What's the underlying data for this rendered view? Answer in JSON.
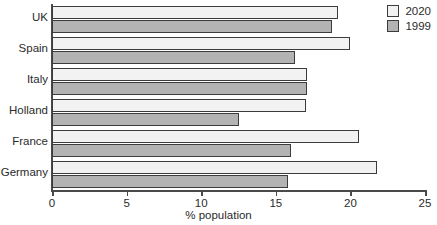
{
  "chart_data": {
    "type": "bar",
    "orientation": "horizontal",
    "title": "",
    "xlabel": "% population",
    "ylabel": "",
    "xlim": [
      0,
      25
    ],
    "xticks": [
      0,
      5,
      10,
      15,
      20,
      25
    ],
    "xtick_labels": [
      "0",
      "5",
      "10",
      "15",
      "20",
      "25"
    ],
    "grid": false,
    "legend_position": "top-right",
    "categories": [
      "UK",
      "Spain",
      "Italy",
      "Holland",
      "France",
      "Germany"
    ],
    "series": [
      {
        "name": "2020",
        "color": "#f2f2f2",
        "values": [
          19.2,
          20.0,
          17.1,
          17.0,
          20.6,
          21.8
        ]
      },
      {
        "name": "1999",
        "color": "#b3b3b3",
        "values": [
          18.8,
          16.3,
          17.1,
          12.5,
          16.0,
          15.8
        ]
      }
    ]
  },
  "legend": {
    "items": [
      {
        "label": "2020"
      },
      {
        "label": "1999"
      }
    ]
  },
  "axis": {
    "x_title": "% population"
  }
}
